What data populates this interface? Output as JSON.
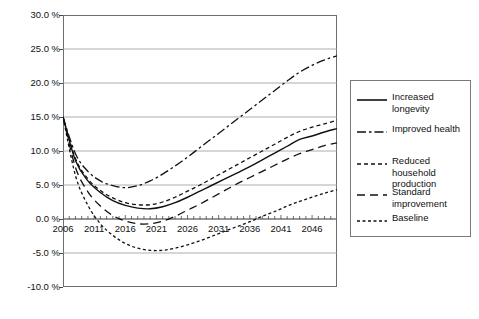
{
  "chart_data": {
    "type": "line",
    "title": "",
    "subtitle": "",
    "xlabel": "",
    "ylabel": "",
    "grid": true,
    "legend_position": "right",
    "xlim": [
      2006,
      2050
    ],
    "ylim": [
      -10.0,
      30.0
    ],
    "y_tick_labels": [
      "30.0 %",
      "25.0 %",
      "20.0 %",
      "15.0 %",
      "10.0 %",
      "5.0 %",
      "0.0 %",
      "-5.0 %",
      "-10.0 %"
    ],
    "y_ticks": [
      30.0,
      25.0,
      20.0,
      15.0,
      10.0,
      5.0,
      0.0,
      -5.0,
      -10.0
    ],
    "x_tick_labels": [
      "2006",
      "2011",
      "2016",
      "2021",
      "2026",
      "2031",
      "2036",
      "2041",
      "2046"
    ],
    "x_ticks": [
      2006,
      2011,
      2016,
      2021,
      2026,
      2031,
      2036,
      2041,
      2046
    ],
    "x": [
      2006,
      2008,
      2010,
      2012,
      2014,
      2016,
      2018,
      2020,
      2022,
      2024,
      2026,
      2028,
      2030,
      2032,
      2034,
      2036,
      2038,
      2040,
      2042,
      2044,
      2046,
      2048,
      2050
    ],
    "series": [
      {
        "name": "Increased longevity",
        "dash": "solid",
        "values": [
          15.0,
          8.6,
          5.6,
          3.9,
          2.7,
          2.0,
          1.6,
          1.5,
          1.8,
          2.4,
          3.2,
          4.1,
          5.0,
          5.9,
          6.8,
          7.7,
          8.7,
          9.7,
          10.7,
          11.7,
          12.2,
          12.8,
          13.3
        ]
      },
      {
        "name": "Improved health",
        "dash": "dashdot-long",
        "values": [
          15.0,
          9.6,
          7.0,
          5.6,
          4.9,
          4.6,
          4.9,
          5.6,
          6.6,
          7.8,
          9.1,
          10.5,
          11.9,
          13.3,
          14.7,
          16.1,
          17.5,
          18.9,
          20.3,
          21.6,
          22.6,
          23.4,
          24.0
        ]
      },
      {
        "name": "Reduced household production",
        "dash": "dashed-short",
        "values": [
          15.0,
          8.9,
          5.9,
          4.2,
          3.1,
          2.4,
          2.1,
          2.1,
          2.5,
          3.2,
          4.1,
          5.0,
          6.0,
          7.0,
          8.0,
          9.0,
          10.0,
          11.0,
          12.0,
          12.9,
          13.5,
          14.0,
          14.5
        ]
      },
      {
        "name": "Standard improvement",
        "dash": "dashed-med",
        "values": [
          15.0,
          7.6,
          4.0,
          1.9,
          0.5,
          -0.3,
          -0.7,
          -0.7,
          -0.3,
          0.4,
          1.3,
          2.2,
          3.2,
          4.2,
          5.2,
          6.1,
          7.0,
          7.9,
          8.8,
          9.6,
          10.2,
          10.8,
          11.2
        ]
      },
      {
        "name": "Baseline",
        "dash": "dashdot",
        "values": [
          15.0,
          6.4,
          2.0,
          -0.7,
          -2.4,
          -3.6,
          -4.3,
          -4.6,
          -4.6,
          -4.3,
          -3.8,
          -3.2,
          -2.5,
          -1.8,
          -1.1,
          -0.4,
          0.4,
          1.1,
          1.9,
          2.6,
          3.2,
          3.8,
          4.3
        ]
      }
    ]
  },
  "legend": {
    "items": [
      {
        "label": "Increased longevity"
      },
      {
        "label": "Improved health"
      },
      {
        "label": "Reduced household production"
      },
      {
        "label": "Standard improvement"
      },
      {
        "label": "Baseline"
      }
    ]
  }
}
